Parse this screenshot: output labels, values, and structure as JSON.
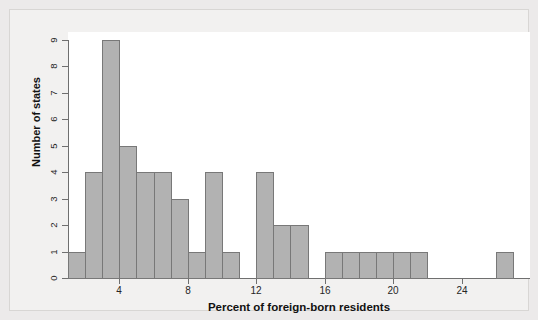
{
  "chart_data": {
    "type": "bar",
    "title": "",
    "subtitle": "",
    "xlabel": "Percent of foreign-born residents",
    "ylabel": "Number of states",
    "grid": false,
    "legend": null,
    "xlim": [
      1,
      28
    ],
    "ylim": [
      0,
      9
    ],
    "bin_width": 1,
    "x_ticks": [
      4,
      8,
      12,
      16,
      20,
      24
    ],
    "x_tick_labels": [
      "4",
      "8",
      "12",
      "16",
      "20",
      "24"
    ],
    "y_ticks": [
      0,
      1,
      2,
      3,
      4,
      5,
      6,
      7,
      8,
      9
    ],
    "y_tick_labels": [
      "0",
      "1",
      "2",
      "3",
      "4",
      "5",
      "6",
      "7",
      "8",
      "9"
    ],
    "bin_edges": [
      1,
      2,
      3,
      4,
      5,
      6,
      7,
      8,
      9,
      10,
      11,
      12,
      13,
      14,
      15,
      16,
      17,
      18,
      19,
      20,
      21,
      22,
      23,
      24,
      25,
      26,
      27,
      28
    ],
    "categories": [
      "1-2",
      "2-3",
      "3-4",
      "4-5",
      "5-6",
      "6-7",
      "7-8",
      "8-9",
      "9-10",
      "10-11",
      "11-12",
      "12-13",
      "13-14",
      "14-15",
      "15-16",
      "16-17",
      "17-18",
      "18-19",
      "19-20",
      "20-21",
      "21-22",
      "22-23",
      "23-24",
      "24-25",
      "25-26",
      "26-27",
      "27-28"
    ],
    "values": [
      1,
      4,
      9,
      5,
      4,
      4,
      3,
      1,
      4,
      1,
      0,
      4,
      2,
      2,
      0,
      1,
      1,
      1,
      1,
      1,
      1,
      0,
      0,
      0,
      0,
      1,
      0
    ],
    "bars": [
      {
        "bin_start": 1,
        "bin_end": 2,
        "count": 1
      },
      {
        "bin_start": 2,
        "bin_end": 3,
        "count": 4
      },
      {
        "bin_start": 3,
        "bin_end": 4,
        "count": 9
      },
      {
        "bin_start": 4,
        "bin_end": 5,
        "count": 5
      },
      {
        "bin_start": 5,
        "bin_end": 6,
        "count": 4
      },
      {
        "bin_start": 6,
        "bin_end": 7,
        "count": 4
      },
      {
        "bin_start": 7,
        "bin_end": 8,
        "count": 3
      },
      {
        "bin_start": 8,
        "bin_end": 9,
        "count": 1
      },
      {
        "bin_start": 9,
        "bin_end": 10,
        "count": 4
      },
      {
        "bin_start": 10,
        "bin_end": 11,
        "count": 1
      },
      {
        "bin_start": 11,
        "bin_end": 12,
        "count": 0
      },
      {
        "bin_start": 12,
        "bin_end": 13,
        "count": 4
      },
      {
        "bin_start": 13,
        "bin_end": 14,
        "count": 2
      },
      {
        "bin_start": 14,
        "bin_end": 15,
        "count": 2
      },
      {
        "bin_start": 15,
        "bin_end": 16,
        "count": 0
      },
      {
        "bin_start": 16,
        "bin_end": 17,
        "count": 1
      },
      {
        "bin_start": 17,
        "bin_end": 18,
        "count": 1
      },
      {
        "bin_start": 18,
        "bin_end": 19,
        "count": 1
      },
      {
        "bin_start": 19,
        "bin_end": 20,
        "count": 1
      },
      {
        "bin_start": 20,
        "bin_end": 21,
        "count": 1
      },
      {
        "bin_start": 21,
        "bin_end": 22,
        "count": 1
      },
      {
        "bin_start": 22,
        "bin_end": 23,
        "count": 0
      },
      {
        "bin_start": 23,
        "bin_end": 24,
        "count": 0
      },
      {
        "bin_start": 24,
        "bin_end": 25,
        "count": 0
      },
      {
        "bin_start": 25,
        "bin_end": 26,
        "count": 0
      },
      {
        "bin_start": 26,
        "bin_end": 27,
        "count": 1
      },
      {
        "bin_start": 27,
        "bin_end": 28,
        "count": 0
      }
    ],
    "colors": {
      "bar_fill": "#b2b2b2",
      "bar_stroke": "#787878",
      "axis": "#6f6f6f",
      "text": "#121212",
      "plot_background": "#ffffff",
      "figure_background": "#f2f1f0"
    },
    "total_count": 50
  }
}
